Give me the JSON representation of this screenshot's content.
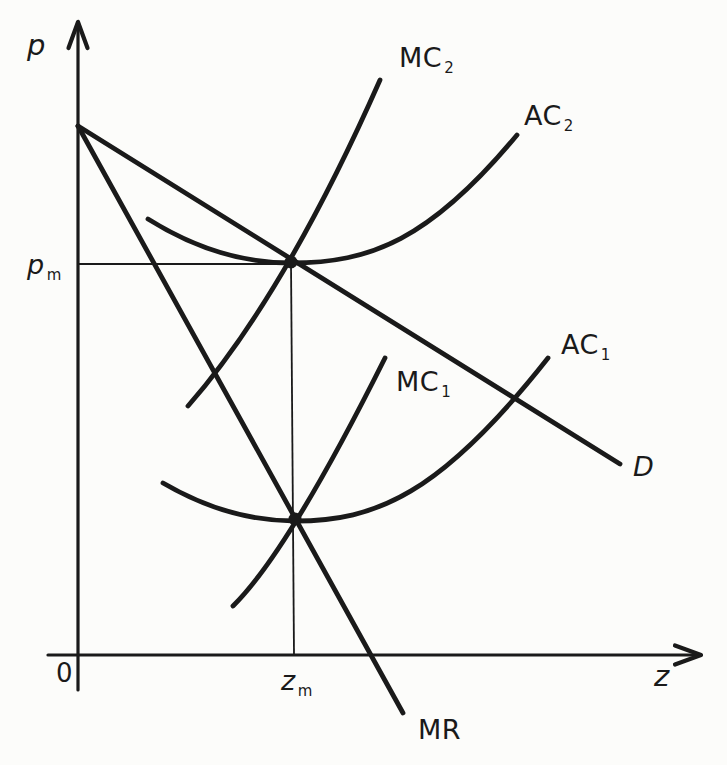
{
  "figure": {
    "ink": "#1a1a1a",
    "paper": "#fcfcfa",
    "description_visible_marks_only": "black line diagram on white background, two filled dots"
  },
  "labels": {
    "p_axis": {
      "base": "p"
    },
    "z_axis": {
      "base": "z"
    },
    "origin": {
      "base": "0"
    },
    "p_m": {
      "base": "p",
      "sub": "m"
    },
    "z_m": {
      "base": "z",
      "sub": "m"
    },
    "mc2": {
      "base": "MC",
      "sub": "2"
    },
    "ac2": {
      "base": "AC",
      "sub": "2"
    },
    "mc1": {
      "base": "MC",
      "sub": "1"
    },
    "ac1": {
      "base": "AC",
      "sub": "1"
    },
    "d": {
      "base": "D"
    },
    "mr": {
      "base": "MR"
    }
  },
  "chart_data": {
    "type": "line",
    "qualitative": true,
    "title": "",
    "xlabel": "z",
    "ylabel": "p",
    "x_tick_labels": [
      "0",
      "z_m"
    ],
    "y_tick_labels": [
      "p_m"
    ],
    "legend": "none (curves labeled inline: MC2, AC2, MC1, AC1, D, MR)",
    "axes": {
      "x": {
        "from": [
          48,
          655
        ],
        "to": [
          701,
          655
        ],
        "label": "z"
      },
      "y": {
        "from": [
          78,
          690
        ],
        "to": [
          78,
          22
        ],
        "label": "p"
      }
    },
    "curves": [
      {
        "name": "D",
        "role": "demand-line",
        "path": [
          [
            "M",
            78,
            126
          ],
          [
            "L",
            620,
            464
          ]
        ]
      },
      {
        "name": "MR",
        "role": "marginal-revenue-line",
        "path": [
          [
            "M",
            78,
            126
          ],
          [
            "L",
            403,
            713
          ]
        ]
      },
      {
        "name": "MC2",
        "role": "marginal-cost-2",
        "path": [
          [
            "M",
            188,
            406
          ],
          [
            "Q",
            285,
            295,
            380,
            80
          ]
        ]
      },
      {
        "name": "AC2",
        "role": "average-cost-2",
        "path": [
          [
            "M",
            148,
            219
          ],
          [
            "Q",
            218,
            263,
            291,
            263
          ],
          [
            "C",
            370,
            263,
            430,
            240,
            517,
            135
          ]
        ]
      },
      {
        "name": "MC1",
        "role": "marginal-cost-1",
        "path": [
          [
            "M",
            233,
            606
          ],
          [
            "Q",
            288,
            552,
            385,
            358
          ]
        ]
      },
      {
        "name": "AC1",
        "role": "average-cost-1",
        "path": [
          [
            "M",
            163,
            483
          ],
          [
            "Q",
            228,
            521,
            295,
            521
          ],
          [
            "C",
            375,
            521,
            440,
            495,
            548,
            358
          ]
        ]
      }
    ],
    "guides": [
      {
        "name": "pm-price-line",
        "path": [
          [
            "M",
            78,
            264
          ],
          [
            "L",
            291,
            264
          ]
        ]
      },
      {
        "name": "zm-quantity-line",
        "path": [
          [
            "M",
            291,
            263
          ],
          [
            "L",
            294,
            655
          ]
        ]
      }
    ],
    "points": [
      {
        "name": "upper-tangency",
        "xy": [
          291,
          262
        ],
        "r": 6.5,
        "meaning": "D crosses minimum of AC2 where MC2 = AC2; defines price p_m at quantity z_m"
      },
      {
        "name": "lower-tangency",
        "xy": [
          295,
          519
        ],
        "r": 6.5,
        "meaning": "MR crosses MC1 at minimum of AC1 at quantity z_m"
      }
    ]
  }
}
